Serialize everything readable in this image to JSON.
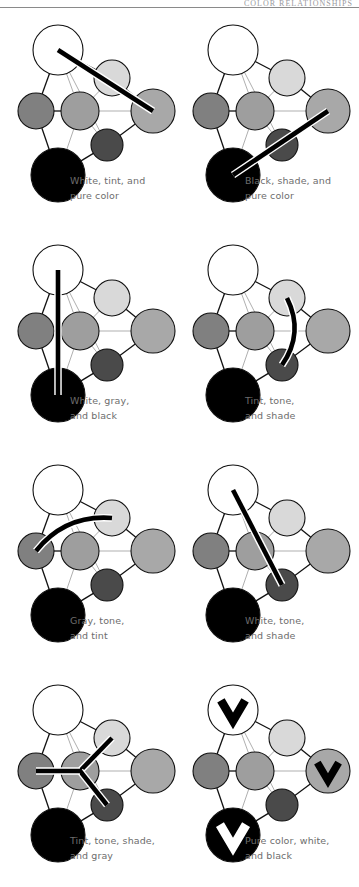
{
  "header": {
    "title": "COLOR RELATIONSHIPS"
  },
  "palette": {
    "white": "#ffffff",
    "tint": "#d9d9d9",
    "pure_color": "#a8a8a8",
    "gray": "#808080",
    "tone": "#9e9e9e",
    "shade": "#4a4a4a",
    "black": "#000000",
    "outline": "#111111",
    "thin_link": "#8c8c8c",
    "thick_link": "#000000",
    "caption_text": "#6d6d6d",
    "rule": "#8a8a8a"
  },
  "nodes": {
    "white": {
      "cx": 50,
      "cy": 32,
      "r": 25,
      "label": "White"
    },
    "tint": {
      "cx": 104,
      "cy": 60,
      "r": 18,
      "label": "Tint"
    },
    "pure_color": {
      "cx": 145,
      "cy": 93,
      "r": 22,
      "label": "Pure color"
    },
    "gray": {
      "cx": 28,
      "cy": 93,
      "r": 18,
      "label": "Gray"
    },
    "tone": {
      "cx": 72,
      "cy": 93,
      "r": 19,
      "label": "Tone"
    },
    "shade": {
      "cx": 99,
      "cy": 127,
      "r": 16,
      "label": "Shade"
    },
    "black": {
      "cx": 50,
      "cy": 157,
      "r": 27,
      "label": "Black"
    }
  },
  "edges": [
    {
      "from": "white",
      "to": "tint",
      "weight": "thick"
    },
    {
      "from": "white",
      "to": "gray",
      "weight": "thick"
    },
    {
      "from": "white",
      "to": "tone",
      "weight": "thin"
    },
    {
      "from": "white",
      "to": "shade",
      "weight": "thin"
    },
    {
      "from": "tint",
      "to": "pure_color",
      "weight": "thick"
    },
    {
      "from": "tint",
      "to": "tone",
      "weight": "thin"
    },
    {
      "from": "gray",
      "to": "tone",
      "weight": "thick"
    },
    {
      "from": "gray",
      "to": "black",
      "weight": "thick"
    },
    {
      "from": "tone",
      "to": "pure_color",
      "weight": "thin"
    },
    {
      "from": "tone",
      "to": "shade",
      "weight": "thin"
    },
    {
      "from": "tone",
      "to": "black",
      "weight": "thin"
    },
    {
      "from": "shade",
      "to": "pure_color",
      "weight": "thick"
    },
    {
      "from": "shade",
      "to": "black",
      "weight": "thick"
    }
  ],
  "diagrams": [
    {
      "id": "white-tint-pure-color",
      "name": "white-tint-and-pure-color",
      "caption_lines": [
        "White, tint, and",
        "pure color"
      ],
      "highlight": {
        "kind": "line",
        "points": [
          "white",
          "pure_color"
        ]
      },
      "checks": []
    },
    {
      "id": "black-shade-pure-color",
      "name": "black-shade-and-pure-color",
      "caption_lines": [
        "Black, shade, and",
        "pure color"
      ],
      "highlight": {
        "kind": "line",
        "points": [
          "black",
          "pure_color"
        ]
      },
      "checks": []
    },
    {
      "id": "white-gray-black",
      "name": "white-gray-and-black",
      "caption_lines": [
        "White, gray,",
        "and black"
      ],
      "highlight": {
        "kind": "line",
        "points": [
          "white",
          "black"
        ]
      },
      "checks": []
    },
    {
      "id": "tint-tone-shade",
      "name": "tint-tone-and-shade",
      "caption_lines": [
        "Tint, tone,",
        "and shade"
      ],
      "highlight": {
        "kind": "curve",
        "points": [
          "tint",
          "shade"
        ],
        "bow": -20
      },
      "checks": []
    },
    {
      "id": "gray-tone-tint",
      "name": "gray-tone-and-tint",
      "caption_lines": [
        "Gray, tone,",
        "and tint"
      ],
      "highlight": {
        "kind": "curve",
        "points": [
          "gray",
          "tint"
        ],
        "bow": -22
      },
      "checks": []
    },
    {
      "id": "white-tone-shade",
      "name": "white-tone-and-shade",
      "caption_lines": [
        "White, tone,",
        "and shade"
      ],
      "highlight": {
        "kind": "line",
        "points": [
          "white",
          "shade"
        ]
      },
      "checks": []
    },
    {
      "id": "tint-tone-shade-gray",
      "name": "tint-tone-shade-and-gray",
      "caption_lines": [
        "Tint, tone, shade,",
        "and gray"
      ],
      "highlight": {
        "kind": "star",
        "center": "tone",
        "points": [
          "tint",
          "shade",
          "gray"
        ]
      },
      "checks": []
    },
    {
      "id": "pure-color-white-black",
      "name": "pure-color-white-and-black",
      "caption_lines": [
        "Pure color, white,",
        "and black"
      ],
      "highlight": {
        "kind": "none",
        "points": []
      },
      "checks": [
        "white",
        "pure_color",
        "black"
      ]
    }
  ]
}
